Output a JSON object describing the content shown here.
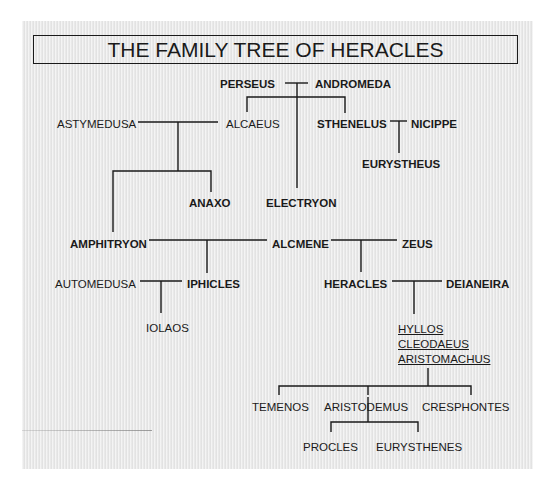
{
  "title": "THE FAMILY TREE OF HERACLES",
  "colors": {
    "background": "#e6e6e6",
    "ink": "#1a1a1a"
  },
  "people": {
    "perseus": "PERSEUS",
    "andromeda": "ANDROMEDA",
    "astymedusa": "ASTYMEDUSA",
    "alcaeus": "ALCAEUS",
    "sthenelus": "STHENELUS",
    "nicippe": "NICIPPE",
    "eurystheus": "EURYSTHEUS",
    "anaxo": "ANAXO",
    "electryon": "ELECTRYON",
    "amphitryon": "AMPHITRYON",
    "alcmene": "ALCMENE",
    "zeus": "ZEUS",
    "automedusa": "AUTOMEDUSA",
    "iphicles": "IPHICLES",
    "iolaos": "IOLAOS",
    "heracles": "HERACLES",
    "deianeira": "DEIANEIRA",
    "hyllos": "HYLLOS",
    "cleodaeus": "CLEODAEUS",
    "aristomachus": "ARISTOMACHUS",
    "temenos": "TEMENOS",
    "aristodemus": "ARISTODEMUS",
    "cresphontes": "CRESPHONTES",
    "procles": "PROCLES",
    "eurysthenes": "EURYSTHENES"
  },
  "relationships": [
    {
      "parents": [
        "PERSEUS",
        "ANDROMEDA"
      ],
      "children": [
        "ALCAEUS",
        "ELECTRYON",
        "STHENELUS"
      ]
    },
    {
      "parents": [
        "ASTYMEDUSA",
        "ALCAEUS"
      ],
      "children": [
        "AMPHITRYON",
        "ANAXO"
      ]
    },
    {
      "parents": [
        "STHENELUS",
        "NICIPPE"
      ],
      "children": [
        "EURYSTHEUS"
      ]
    },
    {
      "parents": [
        "AMPHITRYON",
        "ALCMENE"
      ],
      "children": [
        "IPHICLES"
      ]
    },
    {
      "parents": [
        "ALCMENE",
        "ZEUS"
      ],
      "children": [
        "HERACLES"
      ]
    },
    {
      "parents": [
        "AUTOMEDUSA",
        "IPHICLES"
      ],
      "children": [
        "IOLAOS"
      ]
    },
    {
      "parents": [
        "HERACLES",
        "DEIANEIRA"
      ],
      "children": [
        "HYLLOS",
        "CLEODAEUS",
        "ARISTOMACHUS"
      ]
    },
    {
      "parents": [
        "ARISTOMACHUS"
      ],
      "children": [
        "TEMENOS",
        "ARISTODEMUS",
        "CRESPHONTES"
      ]
    },
    {
      "parents": [
        "ARISTODEMUS"
      ],
      "children": [
        "PROCLES",
        "EURYSTHENES"
      ]
    }
  ]
}
